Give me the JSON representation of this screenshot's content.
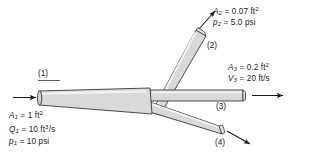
{
  "figure": {
    "background_color": "#ffffff",
    "pipe_fill_color": "#d9d9d9",
    "pipe_highlight_color": "#f0f0f0",
    "pipe_outline_color": "#3a3a3a",
    "arrow_color": "#1a1a1a",
    "text_color": "#1a1a1a"
  },
  "ports": {
    "inlet": {
      "marker": "(1)"
    },
    "branch_upper": {
      "marker": "(2)"
    },
    "branch_middle": {
      "marker": "(3)"
    },
    "branch_lower": {
      "marker": "(4)"
    }
  },
  "annotations": {
    "section1": {
      "area": {
        "symbol": "A",
        "sub": "1",
        "eq": "=",
        "value": "1 ft",
        "exp": "2"
      },
      "flow": {
        "symbol": "Q",
        "sub": "1",
        "eq": "=",
        "value": "10 ft",
        "exp": "3",
        "per": "/s"
      },
      "pressure": {
        "symbol": "p",
        "sub": "1",
        "eq": "=",
        "value": "10 psi"
      }
    },
    "section2": {
      "area": {
        "symbol": "A",
        "sub": "2",
        "eq": "=",
        "value": "0.07 ft",
        "exp": "2"
      },
      "pressure": {
        "symbol": "p",
        "sub": "2",
        "eq": "=",
        "value": "5.0 psi"
      }
    },
    "section3": {
      "area": {
        "symbol": "A",
        "sub": "3",
        "eq": "=",
        "value": "0.2 ft",
        "exp": "2"
      },
      "velocity": {
        "symbol": "V",
        "sub": "3",
        "eq": "=",
        "value": "20 ft/s"
      }
    }
  }
}
